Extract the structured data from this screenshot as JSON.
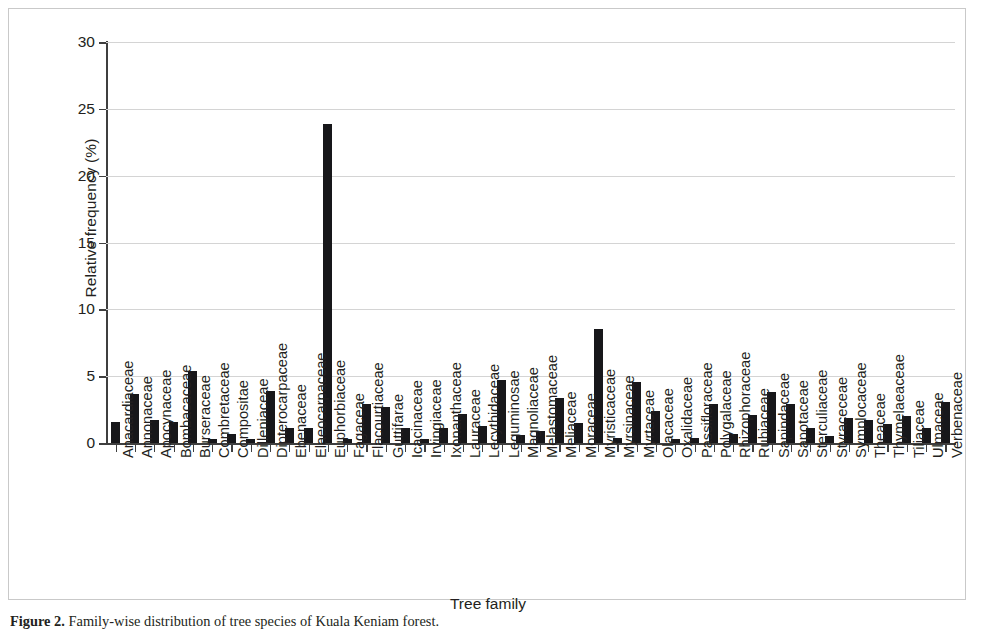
{
  "chart_data": {
    "type": "bar",
    "title": "",
    "xlabel": "Tree family",
    "ylabel": "Relative frequency (%)",
    "ylim": [
      0,
      30
    ],
    "yticks": [
      0,
      5,
      10,
      15,
      20,
      25,
      30
    ],
    "grid": true,
    "legend": null,
    "bar_color": "#17171a",
    "categories": [
      "Anacardiaceae",
      "Annonaceae",
      "Apocynaceae",
      "Bombacaceae",
      "Burseraceae",
      "Combretaceae",
      "Compositae",
      "Dilleniaceae",
      "Dipterocarpaceae",
      "Ebenaceae",
      "Elaeocarpaceae",
      "Euphorbiaceae",
      "Fagaceae",
      "Flacourtiaceae",
      "Guttifarae",
      "Icacinaceae",
      "Irvingiaceae",
      "Ixonanthaceae",
      "Lauraceae",
      "Lecythidaceae",
      "Leguminosae",
      "Magnoliaceae",
      "Melastomaceae",
      "Meliaceae",
      "Moraceae",
      "Myristicaceae",
      "Myrsinaceae",
      "Myrtaceae",
      "Olacaceae",
      "Oxalidaceae",
      "Passifloraceae",
      "Polygalaceae",
      "Rhizophoraceae",
      "Rubiaceae",
      "Sapindaceae",
      "Sapotaceae",
      "Sterculiaceae",
      "Styraceceae",
      "Symplocaceae",
      "Theaceae",
      "Thymelaeaceae",
      "Tiliaceae",
      "Ulmaceae",
      "Verbenaceae"
    ],
    "values": [
      1.6,
      3.7,
      1.7,
      1.6,
      5.4,
      0.3,
      0.7,
      0.3,
      3.9,
      1.1,
      1.1,
      23.9,
      0.3,
      2.9,
      2.7,
      1.1,
      0.3,
      1.1,
      2.2,
      1.3,
      4.7,
      0.6,
      0.9,
      3.4,
      1.5,
      8.5,
      0.4,
      4.6,
      2.4,
      0.3,
      0.4,
      2.9,
      0.7,
      2.1,
      3.8,
      2.9,
      1.1,
      0.5,
      1.9,
      1.7,
      1.4,
      2.0,
      1.1,
      3.1
    ]
  },
  "caption": {
    "label": "Figure 2.",
    "text": "Family-wise distribution of tree species of Kuala Keniam forest."
  }
}
